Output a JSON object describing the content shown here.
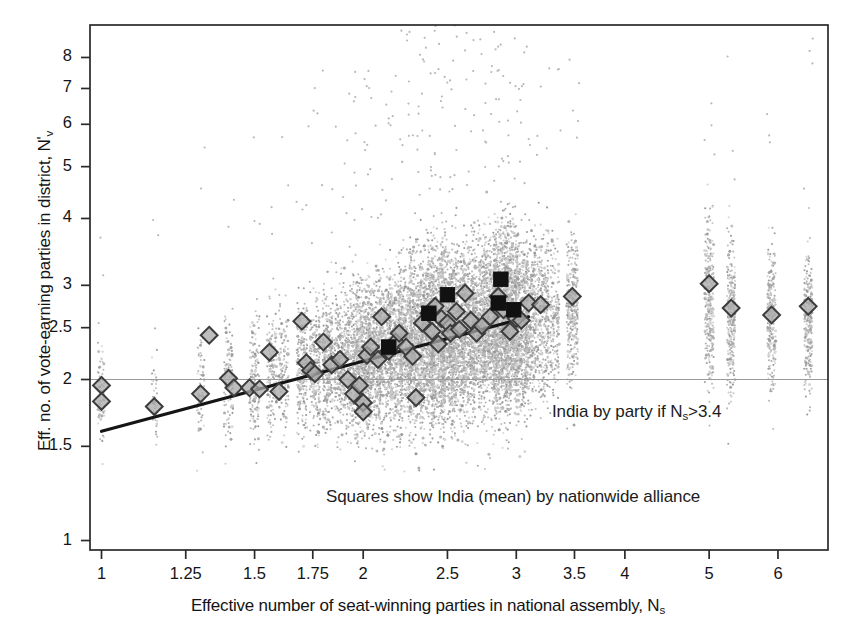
{
  "chart_data": {
    "type": "scatter",
    "title": "",
    "xlabel": "Effective number of seat-winning parties in national assembly, N_s",
    "ylabel": "Eff. no. of vote-earning parties in district, N'_v",
    "xscale": "log",
    "yscale": "log",
    "xlim": [
      0.97,
      6.85
    ],
    "ylim": [
      0.96,
      9.2
    ],
    "xticks": [
      1,
      1.25,
      1.5,
      1.75,
      2,
      2.5,
      3,
      3.5,
      4,
      5,
      6
    ],
    "xticklabels": [
      "1",
      "1.25",
      "1.5",
      "1.75",
      "2",
      "2.5",
      "3",
      "3.5",
      "4",
      "5",
      "6"
    ],
    "yticks": [
      1,
      1.5,
      2,
      2.5,
      3,
      4,
      5,
      6,
      7,
      8
    ],
    "yticklabels": [
      "1",
      "1.5",
      "2",
      "2.5",
      "3",
      "4",
      "5",
      "6",
      "7",
      "8"
    ],
    "grid": false,
    "legend": "none",
    "annotations": [
      {
        "text": "India by party if Ns>3.4",
        "x": 3.52,
        "y": 1.72
      },
      {
        "text": "Squares show India (mean) by nationwide alliance",
        "x": 2.25,
        "y": 1.35
      }
    ],
    "reference_line": {
      "orientation": "horizontal",
      "y": 2.0,
      "color": "#9a9a9a"
    },
    "fit_line": {
      "x0": 1.0,
      "y0": 1.6,
      "x1": 3.1,
      "y1": 2.62,
      "color": "#151515"
    },
    "series": [
      {
        "name": "district-level observations",
        "marker": "point",
        "color": "#b3b3b3",
        "note": "dense vertical strips of small grey dots, one strip per country/election Ns value"
      },
      {
        "name": "country means (diamonds)",
        "marker": "diamond",
        "facecolor": "#a8a8a8",
        "edgecolor": "#3c3c3c",
        "points": [
          [
            1.0,
            1.95
          ],
          [
            1.0,
            1.82
          ],
          [
            1.15,
            1.78
          ],
          [
            1.3,
            1.88
          ],
          [
            1.33,
            2.42
          ],
          [
            1.4,
            2.01
          ],
          [
            1.42,
            1.93
          ],
          [
            1.48,
            1.93
          ],
          [
            1.52,
            1.92
          ],
          [
            1.56,
            2.25
          ],
          [
            1.6,
            1.9
          ],
          [
            1.7,
            2.57
          ],
          [
            1.72,
            2.15
          ],
          [
            1.74,
            2.08
          ],
          [
            1.76,
            2.05
          ],
          [
            1.8,
            2.35
          ],
          [
            1.84,
            2.13
          ],
          [
            1.88,
            2.18
          ],
          [
            1.92,
            2.0
          ],
          [
            1.95,
            1.88
          ],
          [
            1.98,
            1.95
          ],
          [
            2.0,
            1.81
          ],
          [
            2.0,
            1.74
          ],
          [
            2.02,
            2.22
          ],
          [
            2.04,
            2.3
          ],
          [
            2.08,
            2.18
          ],
          [
            2.1,
            2.62
          ],
          [
            2.14,
            2.26
          ],
          [
            2.18,
            2.35
          ],
          [
            2.2,
            2.44
          ],
          [
            2.24,
            2.3
          ],
          [
            2.28,
            2.21
          ],
          [
            2.3,
            1.85
          ],
          [
            2.34,
            2.55
          ],
          [
            2.38,
            2.66
          ],
          [
            2.4,
            2.46
          ],
          [
            2.42,
            2.74
          ],
          [
            2.44,
            2.33
          ],
          [
            2.46,
            2.6
          ],
          [
            2.5,
            2.55
          ],
          [
            2.52,
            2.44
          ],
          [
            2.56,
            2.68
          ],
          [
            2.58,
            2.48
          ],
          [
            2.62,
            2.9
          ],
          [
            2.66,
            2.58
          ],
          [
            2.7,
            2.44
          ],
          [
            2.74,
            2.52
          ],
          [
            2.8,
            2.62
          ],
          [
            2.86,
            2.86
          ],
          [
            2.9,
            2.7
          ],
          [
            2.95,
            2.46
          ],
          [
            3.0,
            2.6
          ],
          [
            3.04,
            2.58
          ],
          [
            3.1,
            2.78
          ],
          [
            3.2,
            2.76
          ],
          [
            3.48,
            2.86
          ],
          [
            5.0,
            3.02
          ],
          [
            5.3,
            2.72
          ],
          [
            5.9,
            2.64
          ],
          [
            6.5,
            2.74
          ]
        ]
      },
      {
        "name": "India (mean) by nationwide alliance",
        "marker": "square",
        "color": "#111111",
        "points": [
          [
            2.14,
            2.3
          ],
          [
            2.38,
            2.66
          ],
          [
            2.5,
            2.88
          ],
          [
            2.86,
            2.78
          ],
          [
            2.88,
            3.08
          ],
          [
            2.98,
            2.7
          ]
        ]
      }
    ]
  },
  "axes": {
    "x_title_prefix": "Effective number of seat-winning parties in national assembly, N",
    "x_title_sub": "s",
    "y_title_prefix": "Eff. no. of vote-earning parties in district, N",
    "y_title_prime": "'",
    "y_title_sub": "v"
  },
  "annotations": {
    "india_by_party_pre": "India by party if N",
    "india_by_party_sub": "s",
    "india_by_party_post": ">3.4",
    "squares_note": "Squares show India (mean) by nationwide alliance"
  }
}
